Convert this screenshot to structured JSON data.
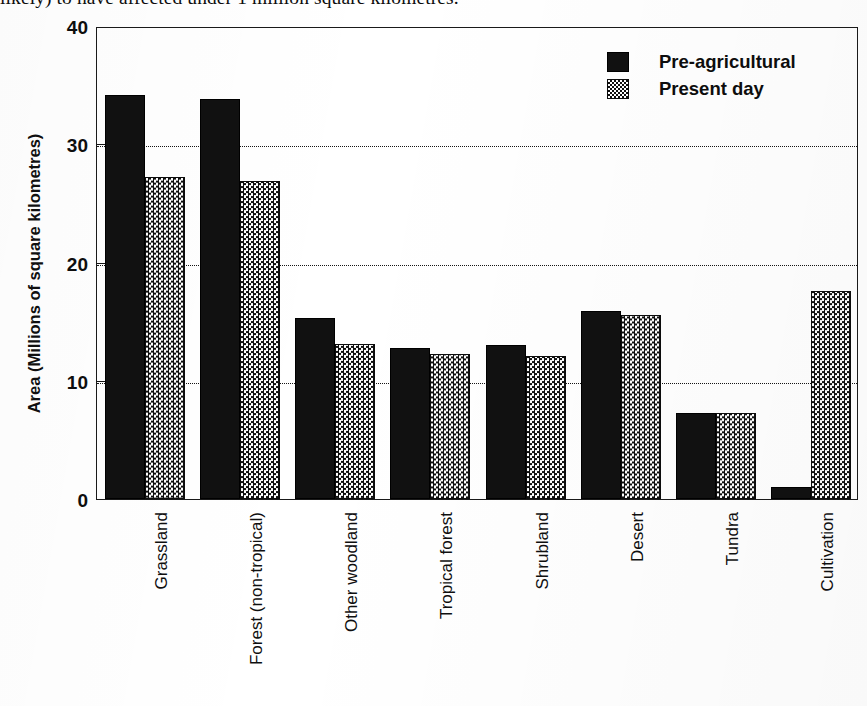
{
  "caption": {
    "text": "likely) to have affected under 1 million square kilometres."
  },
  "legend": {
    "position": "top-right",
    "items": [
      {
        "label": "Pre-agricultural",
        "swatch": "solid-black-swatch"
      },
      {
        "label": "Present day",
        "swatch": "checkered-grey-swatch"
      }
    ]
  },
  "axes": {
    "y_title": "Area (Millions of square kilometres)",
    "y_ticks": [
      "0",
      "10",
      "20",
      "30",
      "40"
    ],
    "x_title": ""
  },
  "chart_data": {
    "type": "bar",
    "title": "",
    "subtitle": "",
    "xlabel": "",
    "ylabel": "Area (Millions of square kilometres)",
    "ylim": [
      0,
      40
    ],
    "yticks": [
      0,
      10,
      20,
      30,
      40
    ],
    "grid": "horizontal-dotted",
    "legend_position": "top-right",
    "categories": [
      "Grassland",
      "Forest (non-tropical)",
      "Other woodland",
      "Tropical forest",
      "Shrubland",
      "Desert",
      "Tundra",
      "Cultivation"
    ],
    "series": [
      {
        "name": "Pre-agricultural",
        "values": [
          34.2,
          33.8,
          15.3,
          12.8,
          13.0,
          15.9,
          7.3,
          1.0
        ]
      },
      {
        "name": "Present day",
        "values": [
          27.2,
          26.9,
          13.1,
          12.3,
          12.1,
          15.6,
          7.3,
          17.6
        ]
      }
    ]
  }
}
